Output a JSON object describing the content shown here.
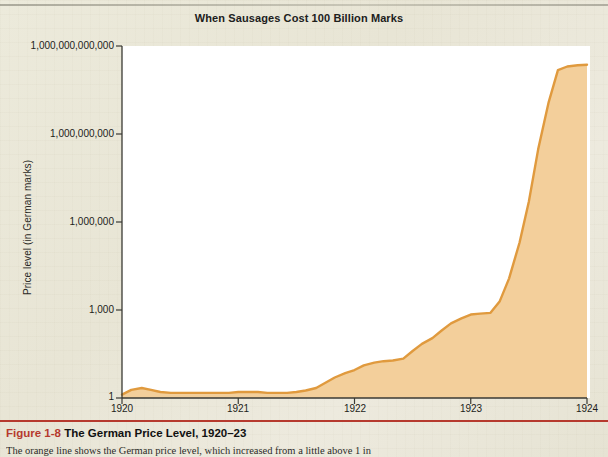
{
  "figure": {
    "caption_number": "Figure 1-8",
    "caption_title": "The German Price Level, 1920–23",
    "caption_body": "The orange line shows the German price level, which increased from a little above 1 in"
  },
  "chart_data": {
    "type": "area",
    "title": "When Sausages Cost 100 Billion Marks",
    "xlabel": "",
    "ylabel": "Price level (in German marks)",
    "yscale": "log",
    "ylim": [
      1,
      1000000000000
    ],
    "xlim": [
      1920,
      1924
    ],
    "grid": false,
    "legend": null,
    "line_color": "#e09a3e",
    "fill_color": "#f3cf9b",
    "ytick_labels": [
      "1,000,000,000,000",
      "1,000,000,000",
      "1,000,000",
      "1,000",
      "1"
    ],
    "ytick_values": [
      1000000000000,
      1000000000,
      1000000,
      1000,
      1
    ],
    "xtick_labels": [
      "1920",
      "1921",
      "1922",
      "1923",
      "1924"
    ],
    "xtick_values": [
      1920,
      1921,
      1922,
      1923,
      1924
    ],
    "x": [
      1920.0,
      1920.08,
      1920.17,
      1920.25,
      1920.33,
      1920.42,
      1920.5,
      1920.58,
      1920.67,
      1920.75,
      1920.83,
      1920.92,
      1921.0,
      1921.08,
      1921.17,
      1921.25,
      1921.33,
      1921.42,
      1921.5,
      1921.58,
      1921.67,
      1921.75,
      1921.83,
      1921.92,
      1922.0,
      1922.08,
      1922.17,
      1922.25,
      1922.33,
      1922.42,
      1922.5,
      1922.58,
      1922.67,
      1922.75,
      1922.83,
      1922.92,
      1923.0,
      1923.08,
      1923.17,
      1923.25,
      1923.33,
      1923.42,
      1923.5,
      1923.58,
      1923.67,
      1923.75,
      1923.83,
      1923.92,
      1924.0
    ],
    "values": [
      1.3,
      1.9,
      2.2,
      1.9,
      1.6,
      1.5,
      1.5,
      1.5,
      1.5,
      1.5,
      1.5,
      1.5,
      1.6,
      1.6,
      1.6,
      1.5,
      1.5,
      1.5,
      1.6,
      1.8,
      2.2,
      3.3,
      5.0,
      7.0,
      9.0,
      13.0,
      16.0,
      18.0,
      19.0,
      22.0,
      40.0,
      70.0,
      110.0,
      200.0,
      350.0,
      520.0,
      700.0,
      750.0,
      800.0,
      2000.0,
      12000.0,
      200000.0,
      5000000.0,
      300000000.0,
      12000000000.0,
      150000000000.0,
      200000000000.0,
      220000000000.0,
      230000000000.0
    ],
    "annotation": "Price level rises from roughly 1 in 1920 to about 2 hundred billion marks by late 1923."
  }
}
